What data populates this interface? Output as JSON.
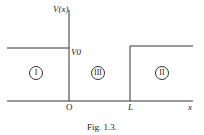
{
  "diagram": {
    "y_axis_label": "V(x)",
    "x_axis_label": "x",
    "potential_label": "V0",
    "origin_label": "O",
    "barrier_edge_label": "L",
    "regions": [
      "I",
      "III",
      "II"
    ],
    "caption": "Fig. 1.3."
  }
}
